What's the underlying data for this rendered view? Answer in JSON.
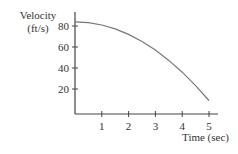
{
  "chart_data": {
    "type": "line",
    "title": "",
    "ylabel": "Velocity (ft/s)",
    "ylabel_lines": [
      "Velocity",
      "(ft/s)"
    ],
    "xlabel": "Time (sec)",
    "x_ticks": [
      1,
      2,
      3,
      4,
      5
    ],
    "y_ticks": [
      20,
      40,
      60,
      80
    ],
    "xlim": [
      0,
      5.3
    ],
    "ylim": [
      0,
      90
    ],
    "grid": false,
    "legend": null,
    "series": [
      {
        "name": "velocity",
        "x": [
          0,
          0.5,
          1,
          1.5,
          2,
          2.5,
          3,
          3.5,
          4,
          4.5,
          5
        ],
        "values": [
          84,
          83.25,
          81,
          77.25,
          72,
          65.25,
          57,
          47.25,
          36,
          23.25,
          9
        ]
      }
    ],
    "colors": {
      "curve": "#777777",
      "axis": "#444444",
      "text": "#333333"
    }
  }
}
